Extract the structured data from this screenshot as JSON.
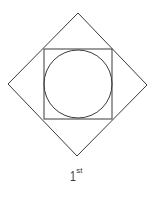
{
  "figure": {
    "label": {
      "number": "1",
      "suffix": "st"
    },
    "shapes": {
      "outer_diamond": {
        "type": "square-rotated-45",
        "vertices": [
          [
            78,
            13
          ],
          [
            147,
            85
          ],
          [
            77,
            156
          ],
          [
            8,
            84
          ]
        ]
      },
      "inner_square": {
        "type": "square",
        "x": 44,
        "y": 49,
        "width": 68,
        "height": 70
      },
      "inscribed_circle": {
        "type": "circle",
        "cx": 78,
        "cy": 84,
        "r": 34
      }
    },
    "colors": {
      "stroke": "#3a3a3a",
      "background": "#ffffff"
    }
  }
}
